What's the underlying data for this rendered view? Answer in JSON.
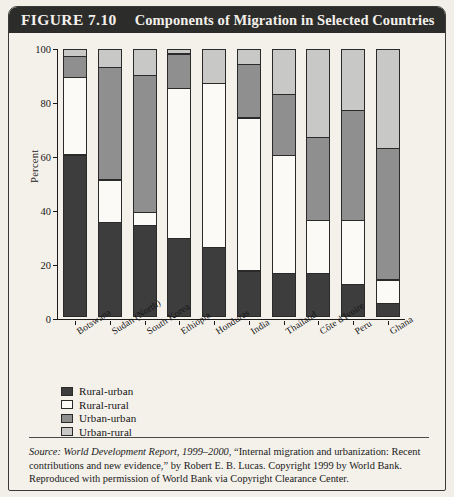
{
  "figure": {
    "number_label": "FIGURE 7.10",
    "title": "Components of Migration in Selected Countries"
  },
  "source_note": {
    "prefix": "Source:",
    "italic_part": "World Development Report, 1999–2000,",
    "rest": " “Internal migration and urbanization: Recent contributions and new evidence,” by Robert E. B. Lucas. Copyright 1999 by World Bank. Reproduced with permission of World Bank via Copyright Clearance Center."
  },
  "colors": {
    "rural_urban": "#3d3d3d",
    "rural_rural": "#fbfaf7",
    "urban_urban": "#8f8f8f",
    "urban_rural": "#c8c8c6",
    "banner_bg": "#2c2c2b",
    "banner_fg": "#f3f0ea",
    "page_bg": "#f4f1eb",
    "ink": "#1a1a1a"
  },
  "chart_data": {
    "type": "bar",
    "stacked": true,
    "title": "Components of Migration in Selected Countries",
    "xlabel": "",
    "ylabel": "Percent",
    "ylim": [
      0,
      100
    ],
    "yticks": [
      0,
      20,
      40,
      60,
      80,
      100
    ],
    "grid": false,
    "legend_position": "below-left",
    "categories": [
      "Botswana",
      "Sudan (North)",
      "South Korea",
      "Ethiopia",
      "Honduras",
      "India",
      "Thailand",
      "Côte d'Ivoire",
      "Peru",
      "Ghana"
    ],
    "series": [
      {
        "name": "Rural-urban",
        "color": "#3d3d3d",
        "values": [
          60,
          35,
          34,
          29,
          26,
          17,
          16,
          16,
          12,
          5
        ]
      },
      {
        "name": "Rural-rural",
        "color": "#fbfaf7",
        "values": [
          29,
          16,
          5,
          56,
          61,
          57,
          44,
          20,
          24,
          9
        ]
      },
      {
        "name": "Urban-urban",
        "color": "#8f8f8f",
        "values": [
          8,
          42,
          51,
          13,
          0,
          20,
          23,
          31,
          41,
          49
        ]
      },
      {
        "name": "Urban-rural",
        "color": "#c8c8c6",
        "values": [
          3,
          7,
          10,
          2,
          13,
          6,
          17,
          33,
          23,
          37
        ]
      }
    ]
  }
}
